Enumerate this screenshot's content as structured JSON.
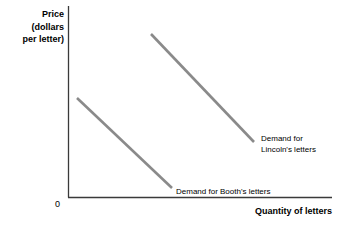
{
  "chart_data": {
    "type": "line",
    "title": "",
    "xlabel": "Quantity of letters",
    "ylabel": "Price (dollars per letter)",
    "ylabel_lines": [
      "Price",
      "(dollars",
      "per letter)"
    ],
    "origin_label": "0",
    "grid": false,
    "legend_position": "inline-annotation",
    "axis_color": "#3a3a3a",
    "curve_color": "#8a8a8a",
    "series": [
      {
        "name": "Demand for Lincoln's letters",
        "label_lines": [
          "Demand for",
          "Lincoln's letters"
        ],
        "x": [
          151,
          254
        ],
        "y": [
          34,
          142
        ],
        "description": "Higher, outward demand curve; downward sloping straight line"
      },
      {
        "name": "Demand for Booth's letters",
        "label_lines": [
          "Demand for Booth's letters"
        ],
        "x": [
          77,
          172
        ],
        "y": [
          98,
          188
        ],
        "description": "Lower, inward demand curve; downward sloping straight line"
      }
    ],
    "axes": {
      "x_start": 68,
      "x_end": 332,
      "y_top": 6,
      "y_bottom": 197
    }
  }
}
